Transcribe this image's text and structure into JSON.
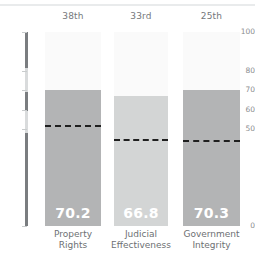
{
  "chart_data": {
    "type": "bar",
    "title": "",
    "subtitle": "",
    "xlabel": "",
    "ylabel": "",
    "ylim": [
      0,
      100
    ],
    "grid": false,
    "legend": "none",
    "categories": [
      "Property Rights",
      "Judicial Effectiveness",
      "Government Integrity"
    ],
    "category_lines": [
      [
        "Property",
        "Rights"
      ],
      [
        "Judicial",
        "Effectiveness"
      ],
      [
        "Government",
        "Integrity"
      ]
    ],
    "values": [
      70.2,
      66.8,
      70.3
    ],
    "value_labels": [
      "70.2",
      "66.8",
      "70.3"
    ],
    "ranks": [
      "38th",
      "33rd",
      "25th"
    ],
    "reference_lines": {
      "label": "world average",
      "values": [
        52.0,
        45.0,
        44.5
      ]
    },
    "y_ticks": [
      0,
      50,
      60,
      70,
      80,
      100
    ],
    "y_tick_labels": [
      "0",
      "50",
      "60",
      "70",
      "80",
      "100"
    ],
    "bar_colors": [
      "#b3b4b5",
      "#d3d5d5",
      "#b3b4b5"
    ],
    "bar_track_color": "#fafafa",
    "axis_color": "#7a7d80",
    "reference_line_color": "#1f1f1f",
    "value_label_color": "#ffffff"
  }
}
